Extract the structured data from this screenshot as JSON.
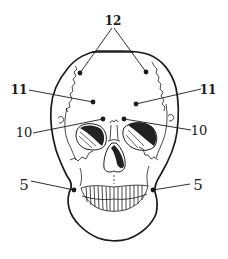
{
  "diagram": {
    "type": "anatomical-point-diagram",
    "colors": {
      "ink": "#1a1a1a",
      "background": "#ffffff",
      "shading": "#222222"
    },
    "points": [
      {
        "id": "12",
        "label": "12",
        "side": "both",
        "markers": [
          [
            80,
            73
          ],
          [
            146,
            72
          ]
        ],
        "label_pos": [
          113,
          25
        ]
      },
      {
        "id": "11-left",
        "label": "11",
        "side": "left",
        "marker": [
          93,
          102
        ],
        "label_pos": [
          19,
          94
        ]
      },
      {
        "id": "11-right",
        "label": "11",
        "side": "right",
        "marker": [
          136,
          104
        ],
        "label_pos": [
          208,
          94
        ]
      },
      {
        "id": "10-left",
        "label": "10",
        "side": "left",
        "marker": [
          103,
          119
        ],
        "label_pos": [
          24,
          137
        ]
      },
      {
        "id": "10-right",
        "label": "10",
        "side": "right",
        "marker": [
          124,
          119
        ],
        "label_pos": [
          199,
          135
        ]
      },
      {
        "id": "5-left",
        "label": "5",
        "side": "left",
        "marker": [
          74,
          190
        ],
        "label_pos": [
          24,
          190
        ]
      },
      {
        "id": "5-right",
        "label": "5",
        "side": "right",
        "marker": [
          153,
          190
        ],
        "label_pos": [
          198,
          190
        ]
      }
    ]
  }
}
